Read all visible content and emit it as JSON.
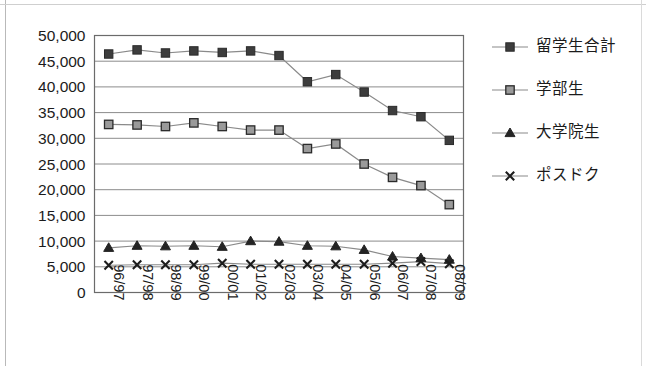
{
  "chart_data": {
    "type": "line",
    "title": "",
    "subtitle": "",
    "xlabel": "",
    "ylabel": "",
    "grid": true,
    "legend_position": "right",
    "ylim": [
      0,
      50000
    ],
    "ytick_step": 5000,
    "ytick_labels": [
      "50,000",
      "45,000",
      "40,000",
      "35,000",
      "30,000",
      "25,000",
      "20,000",
      "15,000",
      "10,000",
      "5,000",
      "0"
    ],
    "ytick_values": [
      50000,
      45000,
      40000,
      35000,
      30000,
      25000,
      20000,
      15000,
      10000,
      5000,
      0
    ],
    "categories": [
      "96/97",
      "97/98",
      "98/99",
      "99/00",
      "00/01",
      "01/02",
      "02/03",
      "03/04",
      "04/05",
      "05/06",
      "06/07",
      "07/08",
      "08/09"
    ],
    "series": [
      {
        "name": "留学生合計",
        "marker": "filled-square",
        "values": [
          46400,
          47200,
          46600,
          47000,
          46700,
          47000,
          46100,
          41000,
          42400,
          39000,
          35400,
          34200,
          29600
        ]
      },
      {
        "name": "学部生",
        "marker": "hollow-square",
        "values": [
          32700,
          32600,
          32300,
          33000,
          32300,
          31600,
          31600,
          28000,
          28900,
          25000,
          22400,
          20800,
          17100
        ]
      },
      {
        "name": "大学院生",
        "marker": "triangle",
        "values": [
          8700,
          9100,
          9000,
          9100,
          8900,
          10000,
          9900,
          9100,
          9000,
          8300,
          7000,
          6700,
          6400
        ]
      },
      {
        "name": "ポスドク",
        "marker": "cross-x",
        "values": [
          5300,
          5400,
          5400,
          5400,
          5700,
          5500,
          5500,
          5500,
          5500,
          5500,
          5700,
          6000,
          5600
        ]
      }
    ]
  },
  "legend": {
    "items": [
      {
        "label": "留学生合計",
        "marker": "filled-square"
      },
      {
        "label": "学部生",
        "marker": "hollow-square"
      },
      {
        "label": "大学院生",
        "marker": "triangle"
      },
      {
        "label": "ポスドク",
        "marker": "cross-x"
      }
    ]
  },
  "colors": {
    "line": "#8a8a8a",
    "marker_dark": "#3d3d3d",
    "marker_light": "#9a9a9a",
    "grid": "#8c8c8c",
    "text": "#1b1b1b",
    "background": "#ffffff"
  }
}
